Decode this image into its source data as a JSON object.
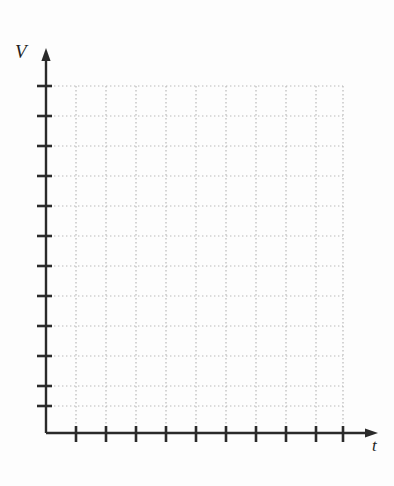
{
  "chart_data": {
    "type": "line",
    "title": "",
    "subtitle": "",
    "xlabel": "t",
    "ylabel": "V",
    "series": [],
    "x": [],
    "categories": [],
    "values": [],
    "annotations": [],
    "legend": [],
    "legend_position": "none",
    "grid": true,
    "grid_style": "dotted",
    "xlim": [
      0,
      10
    ],
    "ylim": [
      0,
      12
    ],
    "x_tick_count": 10,
    "y_tick_count": 12,
    "x_tick_labels": [],
    "y_tick_labels": []
  },
  "axes": {
    "y_label": "V",
    "x_label": "t",
    "origin_x": 46,
    "origin_y": 433,
    "y_arrow_tip_y": 48,
    "x_arrow_tip_x": 378,
    "grid_right_x": 343,
    "grid_top_y": 86,
    "grid_step": 30,
    "colors": {
      "axis": "#2a2a2a",
      "grid": "#b9b9b9",
      "background": "#fdfdfd",
      "label": "#1f1f1f"
    }
  },
  "grid_lines": {
    "vertical_x": [
      76,
      106,
      136,
      166,
      196,
      226,
      256,
      286,
      316,
      343
    ],
    "horizontal_y": [
      86,
      116,
      146,
      176,
      206,
      236,
      266,
      296,
      326,
      356,
      386,
      406
    ]
  },
  "ticks": {
    "x_tick_x": [
      76,
      106,
      136,
      166,
      196,
      226,
      256,
      286,
      316,
      343
    ],
    "y_tick_y": [
      86,
      116,
      146,
      176,
      206,
      236,
      266,
      296,
      326,
      356,
      386,
      406
    ]
  }
}
